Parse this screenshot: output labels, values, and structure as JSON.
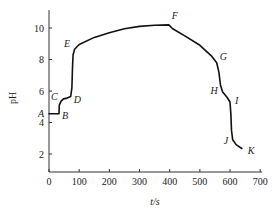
{
  "chart_data": {
    "type": "line",
    "title": "",
    "xlabel": "t/s",
    "ylabel": "pH",
    "xlim": [
      0,
      700
    ],
    "ylim": [
      0.9,
      11.2
    ],
    "xticks": [
      0,
      100,
      200,
      300,
      400,
      500,
      600,
      700
    ],
    "yticks": [
      2,
      4,
      6,
      8,
      10
    ],
    "grid": false,
    "legend": null,
    "series": [
      {
        "name": "pH vs time",
        "color": "#111111",
        "points": [
          [
            0,
            4.55
          ],
          [
            33,
            4.55
          ],
          [
            34,
            5.1
          ],
          [
            40,
            5.35
          ],
          [
            48,
            5.5
          ],
          [
            60,
            5.55
          ],
          [
            72,
            5.65
          ],
          [
            76,
            6.2
          ],
          [
            78,
            7.5
          ],
          [
            80,
            8.3
          ],
          [
            85,
            8.65
          ],
          [
            100,
            8.95
          ],
          [
            150,
            9.4
          ],
          [
            200,
            9.7
          ],
          [
            250,
            9.95
          ],
          [
            300,
            10.1
          ],
          [
            350,
            10.18
          ],
          [
            397,
            10.2
          ],
          [
            410,
            9.95
          ],
          [
            450,
            9.5
          ],
          [
            500,
            8.9
          ],
          [
            540,
            8.2
          ],
          [
            556,
            7.8
          ],
          [
            563,
            7.2
          ],
          [
            568,
            6.4
          ],
          [
            575,
            5.95
          ],
          [
            590,
            5.6
          ],
          [
            600,
            5.3
          ],
          [
            603,
            4.5
          ],
          [
            605,
            3.5
          ],
          [
            609,
            2.9
          ],
          [
            620,
            2.6
          ],
          [
            639,
            2.35
          ]
        ]
      }
    ],
    "annotations": [
      {
        "label": "A",
        "t": 0,
        "pH": 4.55
      },
      {
        "label": "B",
        "t": 33,
        "pH": 4.55
      },
      {
        "label": "C",
        "t": 40,
        "pH": 5.35
      },
      {
        "label": "D",
        "t": 72,
        "pH": 5.65
      },
      {
        "label": "E",
        "t": 83,
        "pH": 8.6
      },
      {
        "label": "F",
        "t": 397,
        "pH": 10.2
      },
      {
        "label": "G",
        "t": 556,
        "pH": 7.8
      },
      {
        "label": "H",
        "t": 575,
        "pH": 5.95
      },
      {
        "label": "I",
        "t": 600,
        "pH": 5.3
      },
      {
        "label": "J",
        "t": 609,
        "pH": 2.9
      },
      {
        "label": "K",
        "t": 639,
        "pH": 2.35
      }
    ]
  },
  "labels": {
    "xlabel": "t/s",
    "ylabel": "pH"
  }
}
